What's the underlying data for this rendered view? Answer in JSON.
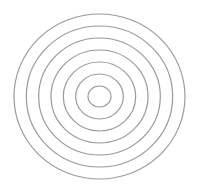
{
  "diagram": {
    "ring_count": 7,
    "colors": {
      "background": "#ffffff",
      "stroke": "#9a9a9a"
    }
  }
}
